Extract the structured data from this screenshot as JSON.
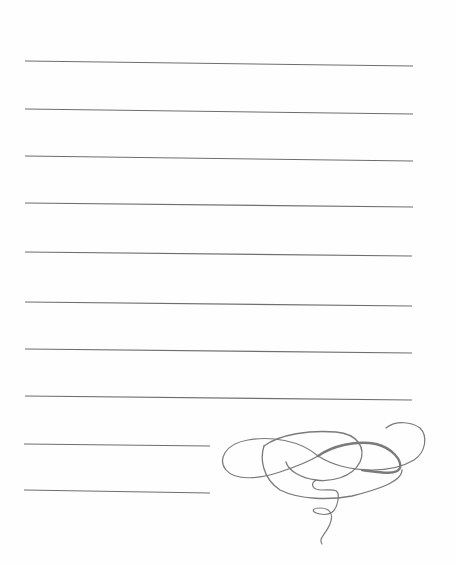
{
  "page": {
    "type": "lined-stationery",
    "background": "#ffffff",
    "line_color": "#6e6e6e",
    "ornament_color": "#7a7a7a"
  },
  "ruled_lines": [
    {
      "x1": 25,
      "y1": 61,
      "x2": 413,
      "y2": 66
    },
    {
      "x1": 25,
      "y1": 109,
      "x2": 413,
      "y2": 114
    },
    {
      "x1": 25,
      "y1": 156,
      "x2": 413,
      "y2": 161
    },
    {
      "x1": 25,
      "y1": 203,
      "x2": 413,
      "y2": 207
    },
    {
      "x1": 25,
      "y1": 252,
      "x2": 412,
      "y2": 256
    },
    {
      "x1": 25,
      "y1": 302,
      "x2": 412,
      "y2": 306
    },
    {
      "x1": 25,
      "y1": 349,
      "x2": 412,
      "y2": 353
    },
    {
      "x1": 25,
      "y1": 396,
      "x2": 412,
      "y2": 400
    },
    {
      "x1": 24,
      "y1": 444,
      "x2": 210,
      "y2": 446
    },
    {
      "x1": 24,
      "y1": 490,
      "x2": 210,
      "y2": 493
    }
  ],
  "ornament": {
    "name": "calligraphic flourish",
    "position": "bottom-right"
  }
}
